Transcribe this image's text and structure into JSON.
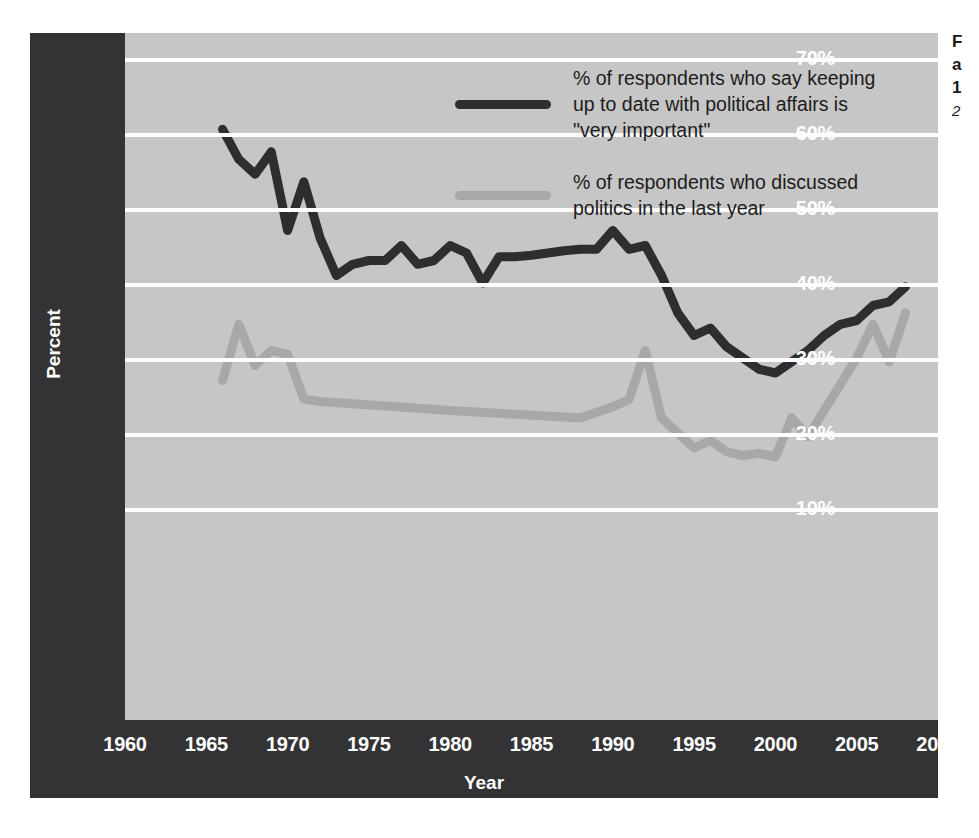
{
  "chart_data": {
    "type": "line",
    "title": "",
    "xlabel": "Year",
    "ylabel": "Percent",
    "xlim": [
      1960,
      2010
    ],
    "ylim": [
      5,
      72
    ],
    "grid": true,
    "legend_position": "inside-top-center",
    "y_ticks": [
      "70%",
      "60%",
      "50%",
      "40%",
      "30%",
      "20%",
      "10%"
    ],
    "y_tick_values": [
      70,
      60,
      50,
      40,
      30,
      20,
      10
    ],
    "x_ticks": [
      "1960",
      "1965",
      "1970",
      "1975",
      "1980",
      "1985",
      "1990",
      "1995",
      "2000",
      "2005",
      "2010"
    ],
    "x_tick_values": [
      1960,
      1965,
      1970,
      1975,
      1980,
      1985,
      1990,
      1995,
      2000,
      2005,
      2010
    ],
    "colors": {
      "series_1": "#2e2e30",
      "series_2": "#a8a8a8",
      "plot_background": "#c6c6c6",
      "axis_panel": "#333336",
      "gridline": "#fdfdfd",
      "page_background": "#ffffff"
    },
    "series": [
      {
        "name": "% of respondents who say keeping up to date with political affairs is \"very important\"",
        "color": "#2e2e30",
        "x": [
          1966,
          1967,
          1968,
          1969,
          1970,
          1971,
          1972,
          1973,
          1974,
          1975,
          1976,
          1977,
          1978,
          1979,
          1980,
          1981,
          1982,
          1983,
          1984,
          1985,
          1986,
          1987,
          1988,
          1989,
          1990,
          1991,
          1992,
          1993,
          1994,
          1995,
          1996,
          1997,
          1998,
          1999,
          2000,
          2001,
          2002,
          2003,
          2004,
          2005,
          2006,
          2007,
          2008
        ],
        "values": [
          60.5,
          56.5,
          54.5,
          57.5,
          47.0,
          53.5,
          46.0,
          41.0,
          42.5,
          43.0,
          43.0,
          45.0,
          42.5,
          43.0,
          45.0,
          44.0,
          40.0,
          43.5,
          43.5,
          43.7,
          44.0,
          44.3,
          44.5,
          44.5,
          47.0,
          44.5,
          45.0,
          41.0,
          36.0,
          33.0,
          34.0,
          31.5,
          30.0,
          28.5,
          28.0,
          29.5,
          31.0,
          33.0,
          34.5,
          35.0,
          37.0,
          37.5,
          39.5
        ]
      },
      {
        "name": "% of respondents who discussed politics in the last year",
        "color": "#a8a8a8",
        "x": [
          1966,
          1967,
          1968,
          1969,
          1970,
          1971,
          1972,
          1976,
          1980,
          1984,
          1988,
          1990,
          1991,
          1992,
          1993,
          1994,
          1995,
          1996,
          1997,
          1998,
          1999,
          2000,
          2001,
          2002,
          2003,
          2004,
          2005,
          2006,
          2007,
          2008
        ],
        "values": [
          27.0,
          34.5,
          29.0,
          31.0,
          30.5,
          24.5,
          24.2,
          23.6,
          23.0,
          22.5,
          22.0,
          23.5,
          24.5,
          31.0,
          22.0,
          20.0,
          18.0,
          19.0,
          17.5,
          17.0,
          17.3,
          16.8,
          22.0,
          19.5,
          23.0,
          26.5,
          30.0,
          34.5,
          29.5,
          36.0
        ]
      }
    ]
  },
  "legend": {
    "entries": [
      {
        "swatch": "dark-line-swatch",
        "label": "% of respondents who say keeping\nup to date with political affairs is\n\"very important\""
      },
      {
        "swatch": "gray-line-swatch",
        "label": "% of respondents who discussed\npolitics in the last year"
      }
    ]
  },
  "axes": {
    "y_label": "Percent",
    "x_label": "Year"
  },
  "caption": {
    "line1": "F",
    "line2": "a",
    "line3": "1",
    "line4": "2"
  }
}
